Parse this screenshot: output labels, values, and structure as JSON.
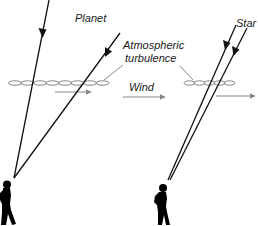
{
  "diagram": {
    "labels": {
      "planet": "Planet",
      "star": "Star",
      "turbulence_line1": "Atmospheric",
      "turbulence_line2": "turbulence",
      "wind": "Wind"
    },
    "colors": {
      "ray": "#111111",
      "turbulence": "#777777",
      "wind_arrow": "#888888",
      "silhouette": "#000000",
      "background": "#ffffff"
    },
    "scenes": [
      {
        "name": "planet-scene",
        "object": "Planet",
        "ray_count": 2,
        "ray_geometry": "converging (extended source)",
        "turbulence_cells": 8
      },
      {
        "name": "star-scene",
        "object": "Star",
        "ray_count": 2,
        "ray_geometry": "near-parallel (point source)",
        "turbulence_cells": 5
      }
    ]
  }
}
